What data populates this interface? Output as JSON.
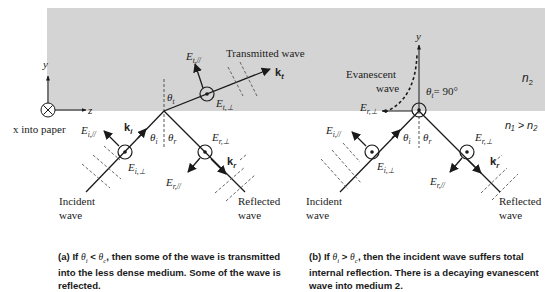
{
  "colors": {
    "medium2_fill": "#d4d4d4",
    "line": "#1a1a1a",
    "dashed": "#555555",
    "background": "#ffffff"
  },
  "axes": {
    "y_label": "y",
    "z_label": "z",
    "x_note": "x into paper"
  },
  "media": {
    "n2_label": "n",
    "n2_sub": "2",
    "relation": "n₁ > n₂"
  },
  "panel_a": {
    "labels": {
      "E_t_par": "E",
      "E_t_par_sub": "t,//",
      "transmitted_wave": "Transmitted wave",
      "k_t": "k",
      "k_t_sub": "t",
      "theta_t": "θ",
      "theta_t_sub": "t",
      "E_t_perp": "E",
      "E_t_perp_sub": "t,⊥",
      "k_i": "k",
      "k_i_sub": "i",
      "E_i_par": "E",
      "E_i_par_sub": "i,//",
      "theta_i": "θ",
      "theta_i_sub": "i",
      "theta_r": "θ",
      "theta_r_sub": "r",
      "E_r_perp": "E",
      "E_r_perp_sub": "r,⊥",
      "E_i_perp": "E",
      "E_i_perp_sub": "i,⊥",
      "k_r": "k",
      "k_r_sub": "r",
      "E_r_par": "E",
      "E_r_par_sub": "r,//",
      "incident_1": "Incident",
      "incident_2": "wave",
      "reflected_1": "Reflected",
      "reflected_2": "wave"
    },
    "caption": {
      "prefix": "(a) If ",
      "cond": "θ",
      "cond_sub1": "i",
      "op": " < ",
      "cond2": "θ",
      "cond_sub2": "c",
      "rest": ", then some of the wave is transmitted into the less dense medium. Some of the wave is reflected."
    }
  },
  "panel_b": {
    "labels": {
      "y": "y",
      "evanescent_1": "Evanescent",
      "evanescent_2": "wave",
      "theta_t_eq": "= 90°",
      "theta_t": "θ",
      "theta_t_sub": "t",
      "E_r_perp_top": "E",
      "E_r_perp_top_sub": "r,⊥",
      "E_i_par": "E",
      "E_i_par_sub": "i,//",
      "theta_i": "θ",
      "theta_i_sub": "i",
      "theta_r": "θ",
      "theta_r_sub": "r",
      "E_r_perp": "E",
      "E_r_perp_sub": "r,⊥",
      "E_i_perp": "E",
      "E_i_perp_sub": "i,⊥",
      "k_r": "k",
      "k_r_sub": "r",
      "E_r_par": "E",
      "E_r_par_sub": "r,//",
      "incident_1": "Incident",
      "incident_2": "wave",
      "reflected_1": "Reflected",
      "reflected_2": "wave"
    },
    "caption": {
      "prefix": "(b) If ",
      "cond": "θ",
      "cond_sub1": "i",
      "op": " > ",
      "cond2": "θ",
      "cond_sub2": "c",
      "rest": ", then the incident wave suffers total internal reflection. There is a decaying evanescent wave into medium 2."
    }
  }
}
